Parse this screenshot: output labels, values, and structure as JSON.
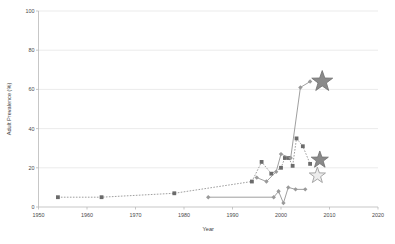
{
  "chart_data": {
    "type": "line",
    "title": "",
    "xlabel": "Year",
    "ylabel": "Adult Prevalence (%)",
    "xlim": [
      1950,
      2020
    ],
    "ylim": [
      0,
      100
    ],
    "xticks": [
      1950,
      1960,
      1970,
      1980,
      1990,
      2000,
      2010,
      2020
    ],
    "xtick_labels": [
      "1950",
      "1960",
      "1970",
      "1980",
      "1990",
      "2000",
      "2010",
      "2020"
    ],
    "yticks": [
      0,
      20,
      40,
      60,
      80,
      100
    ],
    "ytick_labels": [
      "0",
      "20",
      "40",
      "60",
      "80",
      "100"
    ],
    "grid": "horizontal",
    "legend": "none",
    "series": [
      {
        "name": "historic-dashed-series",
        "style": "dashed",
        "marker": "square",
        "color": "#8e8e8e",
        "points": [
          {
            "x": 1954,
            "y": 5
          },
          {
            "x": 1963,
            "y": 5
          },
          {
            "x": 1978,
            "y": 7
          },
          {
            "x": 1994,
            "y": 13
          },
          {
            "x": 1996,
            "y": 23
          },
          {
            "x": 1998,
            "y": 17
          },
          {
            "x": 2000,
            "y": 20
          },
          {
            "x": 2000.8,
            "y": 25
          },
          {
            "x": 2001.6,
            "y": 25
          },
          {
            "x": 2002.4,
            "y": 21
          },
          {
            "x": 2003.2,
            "y": 35
          },
          {
            "x": 2004.5,
            "y": 31
          },
          {
            "x": 2006,
            "y": 22
          }
        ]
      },
      {
        "name": "modern-solid-series",
        "style": "solid",
        "marker": "diamond",
        "color": "#8e8e8e",
        "points": [
          {
            "x": 1985,
            "y": 5
          },
          {
            "x": 1998.5,
            "y": 5
          },
          {
            "x": 1999.5,
            "y": 8
          },
          {
            "x": 2000.5,
            "y": 2
          },
          {
            "x": 2001.5,
            "y": 10
          },
          {
            "x": 2003,
            "y": 9
          },
          {
            "x": 2005,
            "y": 9
          }
        ]
      },
      {
        "name": "rising-solid-series",
        "style": "solid",
        "marker": "diamond",
        "color": "#8e8e8e",
        "points": [
          {
            "x": 1995,
            "y": 15
          },
          {
            "x": 1997,
            "y": 13
          },
          {
            "x": 1999,
            "y": 18
          },
          {
            "x": 2000,
            "y": 27
          },
          {
            "x": 2002,
            "y": 25
          },
          {
            "x": 2004,
            "y": 61
          },
          {
            "x": 2006,
            "y": 64
          }
        ]
      }
    ],
    "annotations": [
      {
        "name": "star-marker-upper",
        "x": 2008.5,
        "y": 64,
        "style": "dark",
        "size": 11
      },
      {
        "name": "star-marker-middle",
        "x": 2008,
        "y": 24,
        "style": "dark",
        "size": 9
      },
      {
        "name": "star-marker-lower",
        "x": 2007.5,
        "y": 16,
        "style": "light",
        "size": 8.5
      }
    ]
  }
}
